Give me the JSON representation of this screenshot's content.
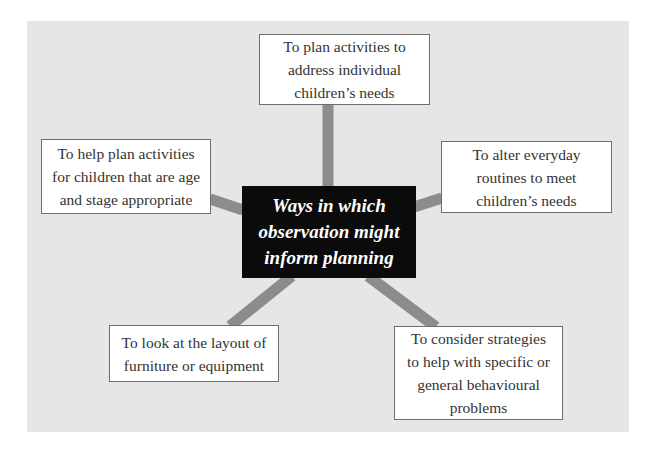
{
  "diagram": {
    "type": "spider-diagram",
    "center": {
      "label": "Ways in which\nobservation might\ninform planning"
    },
    "nodes": [
      {
        "id": "top",
        "label": "To plan activities to\naddress individual\nchildren’s needs"
      },
      {
        "id": "upper-left",
        "label": "To help plan activities\nfor children that are age\nand stage appropriate"
      },
      {
        "id": "upper-right",
        "label": "To alter everyday\nroutines to meet\nchildren’s needs"
      },
      {
        "id": "lower-left",
        "label": "To look at the layout of\nfurniture or equipment"
      },
      {
        "id": "lower-right",
        "label": "To consider strategies\nto help with specific or\ngeneral behavioural\nproblems"
      }
    ],
    "colors": {
      "panel": "#e6e6e6",
      "connector": "#8c8c8c",
      "center_bg": "#0b0b0b",
      "center_text": "#ffffff",
      "box_bg": "#ffffff",
      "box_border": "#6e6e6e",
      "box_text": "#333333"
    }
  }
}
